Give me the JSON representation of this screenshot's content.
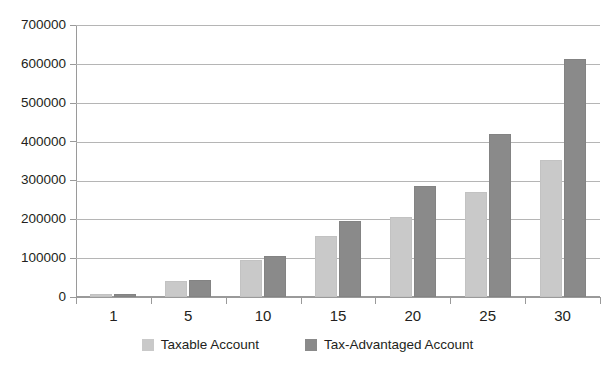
{
  "chart_data": {
    "type": "bar",
    "title": "",
    "subtitle": "",
    "xlabel": "",
    "ylabel": "",
    "categories": [
      "1",
      "5",
      "10",
      "15",
      "20",
      "25",
      "30"
    ],
    "series": [
      {
        "name": "Taxable Account",
        "color": "#c9c9c9",
        "values": [
          8000,
          42000,
          95000,
          158000,
          205000,
          270000,
          352000
        ]
      },
      {
        "name": "Tax-Advantaged Account",
        "color": "#8a8a8a",
        "values": [
          8500,
          45000,
          106000,
          196000,
          286000,
          419000,
          612000
        ]
      }
    ],
    "ylim": [
      0,
      700000
    ],
    "yticks": [
      0,
      100000,
      200000,
      300000,
      400000,
      500000,
      600000,
      700000
    ],
    "ytick_labels": [
      "0",
      "100000",
      "200000",
      "300000",
      "400000",
      "500000",
      "600000",
      "700000"
    ],
    "grid": true,
    "grid_axis": "y",
    "legend_position": "bottom"
  },
  "legend": {
    "entries": [
      {
        "label": "Taxable Account",
        "swatch": "taxable"
      },
      {
        "label": "Tax-Advantaged Account",
        "swatch": "advantaged"
      }
    ]
  }
}
